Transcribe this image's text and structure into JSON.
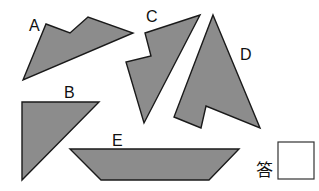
{
  "figure": {
    "shapes": [
      {
        "id": "A",
        "label": "A",
        "points": "23,80 46,24 70,33 88,17 133,33",
        "label_pos": [
          29,
          31
        ]
      },
      {
        "id": "B",
        "label": "B",
        "points": "22,102 99,102 22,180",
        "label_pos": [
          64,
          98
        ]
      },
      {
        "id": "C",
        "label": "C",
        "points": "145,33 200,15 144,123 126,62 151,56",
        "label_pos": [
          146,
          22
        ]
      },
      {
        "id": "D",
        "label": "D",
        "points": "213,15 260,128 206,106 201,128 174,117",
        "label_pos": [
          240,
          60
        ]
      },
      {
        "id": "E",
        "label": "E",
        "points": "70,149 239,149 209,180 101,180",
        "label_pos": [
          112,
          146
        ]
      }
    ],
    "fill_color": "#8c8c8c",
    "stroke_color": "#1a1a1a"
  },
  "answer": {
    "prompt": "答",
    "value": ""
  }
}
